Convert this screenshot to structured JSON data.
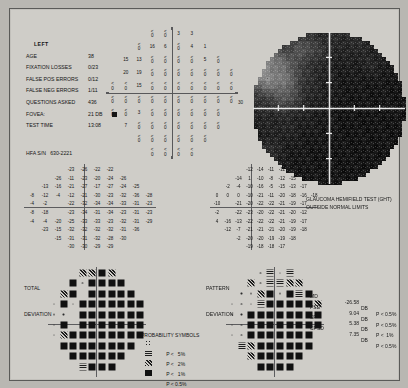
{
  "report": {
    "eye": "LEFT",
    "fields": [
      {
        "key": "AGE",
        "value": "38"
      },
      {
        "key": "FIXATION LOSSES",
        "value": "0/23"
      },
      {
        "key": "FALSE POS ERRORS",
        "value": "0/12"
      },
      {
        "key": "FALSE NEG ERRORS",
        "value": "1/11"
      },
      {
        "key": "QUESTIONS ASKED",
        "value": "436"
      },
      {
        "key": "FOVEA:",
        "value": "21 DB"
      },
      {
        "key": "TEST TIME",
        "value": "13:08"
      }
    ],
    "serial": "HFA S/N   630-2221",
    "degree_label": "30",
    "ght_title": "GLAUCOMA HEMIFIELD TEST (GHT)",
    "ght_result": "OUTSIDE NORMAL LIMITS",
    "total_deviation_label_1": "TOTAL",
    "total_deviation_label_2": "DEVIATION",
    "pattern_deviation_label_1": "PATTERN",
    "pattern_deviation_label_2": "DEVIATION"
  },
  "global_indices": [
    {
      "name": "MD",
      "value": "-26.58",
      "unit": "DB",
      "p": "P < 0.5%"
    },
    {
      "name": "PSD",
      "value": "9.04",
      "unit": "DB",
      "p": "P < 0.5%"
    },
    {
      "name": "SF",
      "value": "5.38",
      "unit": "DB",
      "p": "P <  1%"
    },
    {
      "name": "CPSD",
      "value": "7.35",
      "unit": "DB",
      "p": "P < 0.5%"
    }
  ],
  "legend": {
    "title": "PROBABILITY SYMBOLS",
    "rows": [
      {
        "sym": "p5",
        "text": "P <   5%"
      },
      {
        "sym": "p2",
        "text": "P <   2%"
      },
      {
        "sym": "p1",
        "text": "P <   1%"
      },
      {
        "sym": "p05",
        "text": "P < 0.5%"
      }
    ]
  },
  "chart_data": {
    "type": "heatmap",
    "xlabel": "degrees (nasal/temporal)",
    "ylabel": "degrees (superior/inferior)",
    "grid": true,
    "legend_position": "bottom-center",
    "threshold_units": "dB",
    "threshold_grid": [
      [
        null,
        null,
        null,
        "<0",
        "<0",
        "3",
        "3",
        null,
        null,
        null
      ],
      [
        null,
        null,
        "<0",
        "16",
        "6",
        "<0",
        "4",
        "1",
        null,
        null
      ],
      [
        null,
        "15",
        "13",
        "<0",
        "<0",
        "<0",
        "<0",
        "5",
        "<0",
        null
      ],
      [
        null,
        "20",
        "19",
        "<0",
        "<0",
        "<0",
        "<0",
        "<0",
        "<0",
        "<0"
      ],
      [
        "<0",
        "<0",
        "15",
        "<0",
        "<0",
        "<0",
        "<0",
        "<0",
        "<0",
        "<0"
      ],
      [
        "<0",
        "<0",
        "<0",
        "<0",
        "<0",
        "<0",
        "<0",
        "<0",
        "<0",
        "<0"
      ],
      [
        "<0",
        "<0",
        "3",
        "<0",
        "<0",
        "<0",
        "<0",
        "<0",
        "<0",
        null
      ],
      [
        null,
        "7",
        "<0",
        "<0",
        "<0",
        "<0",
        "<0",
        "<0",
        "<0",
        null
      ],
      [
        null,
        null,
        "<0",
        "<0",
        "<0",
        "<0",
        "<0",
        "<0",
        null,
        null
      ],
      [
        null,
        null,
        null,
        "<0",
        "<0",
        "<0",
        "<0",
        null,
        null,
        null
      ]
    ],
    "total_deviation": [
      [
        null,
        null,
        null,
        "-23",
        "-26",
        "-22",
        "-22",
        null,
        null,
        null
      ],
      [
        null,
        null,
        "-26",
        "-11",
        "-23",
        "-20",
        "-24",
        "-26",
        null,
        null
      ],
      [
        null,
        "-13",
        "-16",
        "-21",
        "-27",
        "-17",
        "-27",
        "-24",
        "-25",
        null
      ],
      [
        "-8",
        "-12",
        "-4",
        "-12",
        "-21",
        "-30",
        "-23",
        "-32",
        "-36",
        "-28"
      ],
      [
        "-4",
        "-2",
        "",
        "-22",
        "-32",
        "-34",
        "-34",
        "-33",
        "-31",
        "-23"
      ],
      [
        "-8",
        "-18",
        "",
        "-23",
        "-34",
        "-31",
        "-34",
        "-23",
        "-31",
        "-23"
      ],
      [
        "-4",
        "-4",
        "-20",
        "-25",
        "-33",
        "-33",
        "-23",
        "-32",
        "-31",
        "-29"
      ],
      [
        null,
        "-23",
        "-15",
        "-32",
        "-32",
        "-32",
        "-32",
        "-31",
        "-36",
        null
      ],
      [
        null,
        null,
        "-15",
        "-31",
        "-31",
        "-32",
        "-28",
        "-30",
        null,
        null
      ],
      [
        null,
        null,
        null,
        "-30",
        "-30",
        "-29",
        "-29",
        null,
        null,
        null
      ]
    ],
    "pattern_deviation": [
      [
        null,
        null,
        null,
        "-12",
        "-14",
        "-11",
        "-11",
        null,
        null,
        null
      ],
      [
        null,
        null,
        "-14",
        "1",
        "-10",
        "-8",
        "-12",
        "-15",
        null,
        null
      ],
      [
        null,
        "-2",
        "-4",
        "-10",
        "-16",
        "-5",
        "-15",
        "-13",
        "-17",
        null
      ],
      [
        "0",
        "0",
        "0",
        "-10",
        "-21",
        "-11",
        "-20",
        "-18",
        "-16",
        "-18"
      ],
      [
        "-10",
        "",
        "-21",
        "-20",
        "-22",
        "-22",
        "-21",
        "-19",
        "-17",
        ""
      ],
      [
        "-2",
        "",
        "-22",
        "-23",
        "-20",
        "-22",
        "-21",
        "-20",
        "-12",
        ""
      ],
      [
        "4",
        "-16",
        "-13",
        "-22",
        "-22",
        "-22",
        "-21",
        "-19",
        "-17",
        ""
      ],
      [
        null,
        "-12",
        "-7",
        "-21",
        "-21",
        "-21",
        "-20",
        "-19",
        "-18",
        null
      ],
      [
        null,
        null,
        "-2",
        "-20",
        "-20",
        "-19",
        "-19",
        "-18",
        null,
        null
      ],
      [
        null,
        null,
        null,
        "-19",
        "-18",
        "-18",
        "-17",
        null,
        null,
        null
      ]
    ],
    "total_deviation_symbols": [
      [
        null,
        null,
        null,
        "p1",
        "p1",
        "p05",
        "p1",
        null,
        null,
        null
      ],
      [
        null,
        null,
        "p05",
        "dot",
        "p05",
        "p05",
        "p05",
        "p05",
        null,
        null
      ],
      [
        null,
        "p1",
        "p05",
        "blank",
        "p05",
        "p05",
        "p05",
        "p05",
        "p05",
        null
      ],
      [
        "dot",
        "p05",
        "dot",
        "p05",
        "p05",
        "p05",
        "p05",
        "p05",
        "p05",
        "p05"
      ],
      [
        "dot",
        "dot",
        "blank",
        "p05",
        "p05",
        "p05",
        "p05",
        "p05",
        "p05",
        "p05"
      ],
      [
        "dot",
        "p05",
        "blank",
        "p05",
        "p05",
        "p05",
        "p05",
        "p05",
        "p05",
        "p05"
      ],
      [
        "dot",
        "p1",
        "p05",
        "p05",
        "p05",
        "p05",
        "p05",
        "p05",
        "p05",
        "p05"
      ],
      [
        null,
        "p05",
        "p05",
        "p05",
        "p05",
        "p05",
        "p05",
        "p05",
        "p05",
        null
      ],
      [
        null,
        null,
        "p05",
        "p05",
        "p05",
        "p05",
        "p05",
        "p05",
        null,
        null
      ],
      [
        null,
        null,
        null,
        "p2",
        "p05",
        "p05",
        "p05",
        null,
        null,
        null
      ]
    ],
    "pattern_deviation_symbols": [
      [
        null,
        null,
        null,
        "dot",
        "p2",
        "dot",
        "p2",
        null,
        null,
        null
      ],
      [
        null,
        null,
        "p1",
        "dot",
        "p2",
        "p2",
        "p1",
        "p1",
        null,
        null
      ],
      [
        null,
        "dot",
        "dot",
        "p1",
        "p05",
        "dot",
        "p05",
        "p2",
        "p05",
        null
      ],
      [
        "dot",
        "dot",
        "dot",
        "p2",
        "p05",
        "p05",
        "p05",
        "p05",
        "p05",
        "p1"
      ],
      [
        "dot",
        "dot",
        "p05",
        "p05",
        "p05",
        "p05",
        "p05",
        "p05",
        "p05",
        "p05"
      ],
      [
        "dot",
        "dot",
        "p05",
        "p05",
        "p05",
        "p05",
        "p05",
        "p05",
        "p05",
        "p05"
      ],
      [
        "dot",
        "dot",
        "p05",
        "p05",
        "p05",
        "p05",
        "p05",
        "p05",
        "p05",
        ""
      ],
      [
        null,
        "p2",
        "p1",
        "p05",
        "p05",
        "p05",
        "p05",
        "p05",
        "p05",
        null
      ],
      [
        null,
        null,
        "p1",
        "p05",
        "p05",
        "p05",
        "p05",
        "p05",
        null,
        null
      ],
      [
        null,
        null,
        null,
        "p05",
        "p05",
        "p05",
        "p05",
        null,
        null,
        null
      ]
    ]
  }
}
